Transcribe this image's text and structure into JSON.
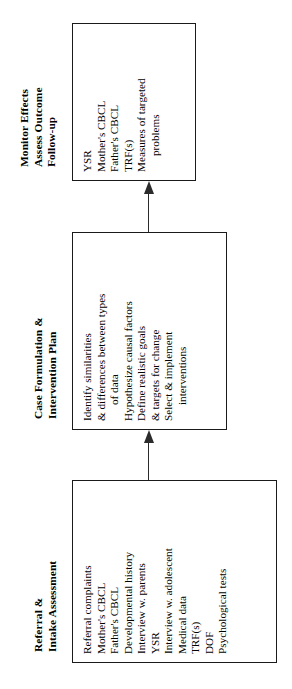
{
  "diagram": {
    "orientation": "rotated-90-counterclockwise",
    "text_color": "#000000",
    "border_color": "#1a1a1a",
    "background_color": "#ffffff",
    "stages": [
      {
        "id": "referral-intake",
        "title_lines": [
          "Referral &",
          "Intake Assessment"
        ],
        "items": [
          "Referral complaints",
          "Mother's CBCL",
          "Father's CBCL",
          "Developmental history",
          "Interview w. parents",
          "YSR",
          "Interview w. adolescent",
          "Medical data",
          "TRF(s)",
          "DOF",
          "Psychological tests"
        ]
      },
      {
        "id": "case-formulation",
        "title_lines": [
          "Case Formulation &",
          "Intervention Plan"
        ],
        "items": [
          "Identify similarities",
          "& differences between types",
          "of data",
          "Hypothesize causal factors",
          "Define realistic goals",
          "& targets for change",
          "Select & implement",
          "interventions"
        ]
      },
      {
        "id": "monitor-outcome",
        "title_lines": [
          "Monitor Effects",
          "Assess Outcome",
          "Follow-up"
        ],
        "items": [
          "YSR",
          "Mother's CBCL",
          "Father's CBCL",
          "TRF(s)",
          "Measures of targeted",
          "problems"
        ]
      }
    ],
    "connectors": [
      {
        "id": "referral-to-formulation",
        "from": "referral-intake",
        "to": "case-formulation",
        "direction": "up"
      },
      {
        "id": "formulation-to-monitor",
        "from": "case-formulation",
        "to": "monitor-outcome",
        "direction": "up"
      }
    ]
  }
}
